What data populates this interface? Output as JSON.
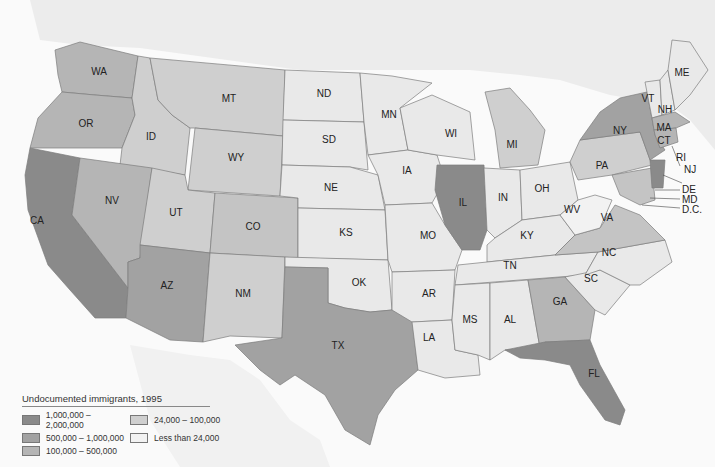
{
  "legend": {
    "title": "Undocumented immigrants, 1995",
    "items": [
      {
        "label": "1,000,000 – 2,000,000",
        "color": "#8a8a8a"
      },
      {
        "label": "24,000 – 100,000",
        "color": "#cfcfcf"
      },
      {
        "label": "500,000 – 1,000,000",
        "color": "#a2a2a2"
      },
      {
        "label": "Less than 24,000",
        "color": "#f2f2f2"
      },
      {
        "label": "100,000 – 500,000",
        "color": "#b5b5b5"
      }
    ]
  },
  "colors": {
    "c1": "#8a8a8a",
    "c2": "#a2a2a2",
    "c3": "#b5b5b5",
    "c4": "#cfcfcf",
    "c5": "#e9e9e9",
    "background": "#fafafa",
    "canada": "#ececec"
  },
  "states": {
    "WA": "WA",
    "OR": "OR",
    "CA": "CA",
    "ID": "ID",
    "NV": "NV",
    "MT": "MT",
    "WY": "WY",
    "UT": "UT",
    "AZ": "AZ",
    "CO": "CO",
    "NM": "NM",
    "ND": "ND",
    "SD": "SD",
    "NE": "NE",
    "KS": "KS",
    "OK": "OK",
    "TX": "TX",
    "MN": "MN",
    "IA": "IA",
    "MO": "MO",
    "AR": "AR",
    "LA": "LA",
    "WI": "WI",
    "IL": "IL",
    "MI": "MI",
    "IN": "IN",
    "OH": "OH",
    "KY": "KY",
    "TN": "TN",
    "MS": "MS",
    "AL": "AL",
    "GA": "GA",
    "FL": "FL",
    "SC": "SC",
    "NC": "NC",
    "VA": "VA",
    "WV": "WV",
    "PA": "PA",
    "NY": "NY",
    "VT": "VT",
    "NH": "NH",
    "ME": "ME",
    "MA": "MA",
    "CT": "CT",
    "RI": "RI",
    "NJ": "NJ",
    "DE": "DE",
    "MD": "MD",
    "DC": "D.C."
  }
}
